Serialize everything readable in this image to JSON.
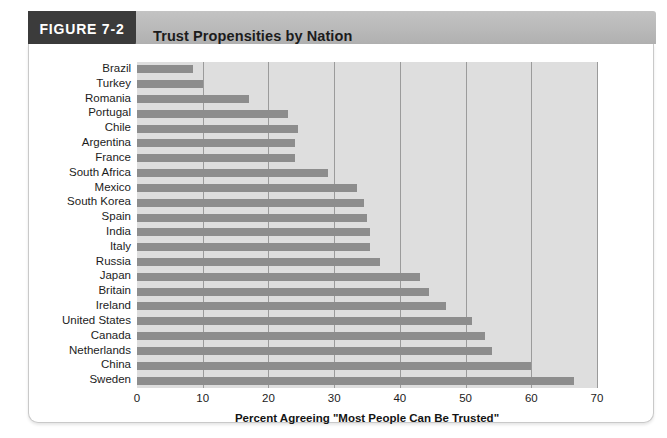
{
  "figure": {
    "tab_label": "FIGURE 7-2",
    "title": "Trust Propensities by Nation",
    "tab_color": "#3b3b3b",
    "band_color": "#b9b9b9"
  },
  "chart_data": {
    "type": "bar",
    "orientation": "horizontal",
    "title": "Trust Propensities by Nation",
    "xlabel": "Percent Agreeing \"Most People Can Be Trusted\"",
    "ylabel": "",
    "xlim": [
      0,
      70
    ],
    "xticks": [
      0,
      10,
      20,
      30,
      40,
      50,
      60,
      70
    ],
    "grid": true,
    "legend": "none",
    "bar_color": "#8d8d8d",
    "plot_background": "#dedede",
    "categories": [
      "Brazil",
      "Turkey",
      "Romania",
      "Portugal",
      "Chile",
      "Argentina",
      "France",
      "South Africa",
      "Mexico",
      "South Korea",
      "Spain",
      "India",
      "Italy",
      "Russia",
      "Japan",
      "Britain",
      "Ireland",
      "United States",
      "Canada",
      "Netherlands",
      "China",
      "Sweden"
    ],
    "values": [
      8.5,
      10,
      17,
      23,
      24.5,
      24,
      24,
      29,
      33.5,
      34.5,
      35,
      35.5,
      35.5,
      37,
      43,
      44.5,
      47,
      51,
      53,
      54,
      60,
      66.5
    ]
  }
}
